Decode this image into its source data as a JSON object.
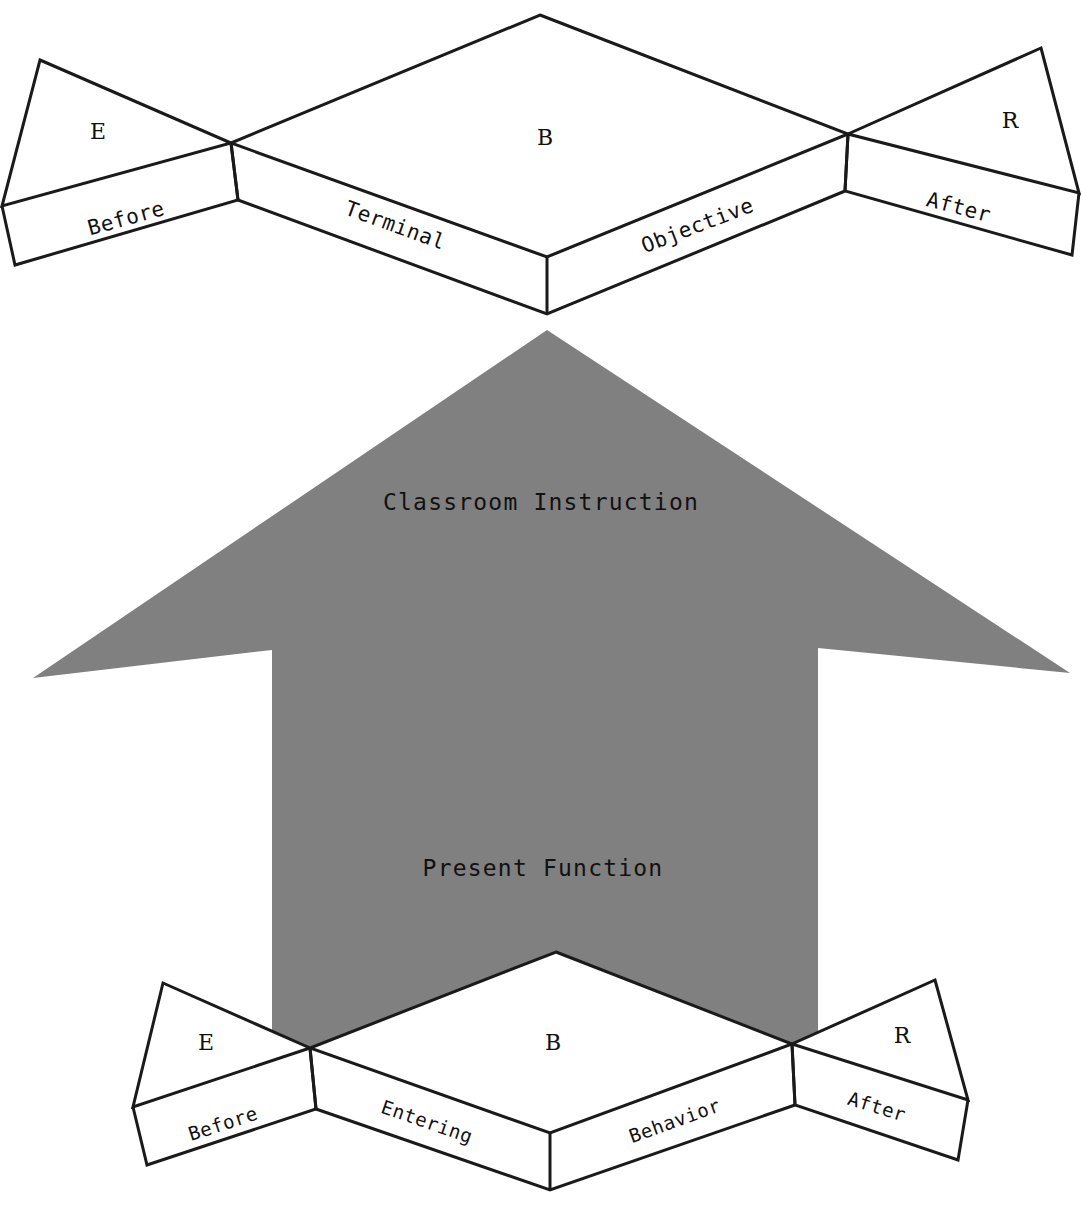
{
  "diagram": {
    "colors": {
      "arrow_gray": "#808080",
      "line_black": "#1a1a1a",
      "face_white": "#ffffff",
      "background": "#ffffff"
    },
    "top_block": {
      "name": "Terminal Objective block",
      "top_face_label": "B",
      "front_left_label": "Terminal",
      "front_right_label": "Objective",
      "left_wing_label": "E",
      "left_wing_front_label": "Before",
      "right_wing_label": "R",
      "right_wing_front_label": "After"
    },
    "arrow": {
      "name": "upward arrow",
      "upper_label": "Classroom Instruction",
      "lower_label": "Present Function",
      "direction": "up",
      "fill": "#808080"
    },
    "bottom_block": {
      "name": "Entering Behavior block",
      "top_face_label": "B",
      "front_left_label": "Entering",
      "front_right_label": "Behavior",
      "left_wing_label": "E",
      "left_wing_front_label": "Before",
      "right_wing_label": "R",
      "right_wing_front_label": "After"
    }
  }
}
